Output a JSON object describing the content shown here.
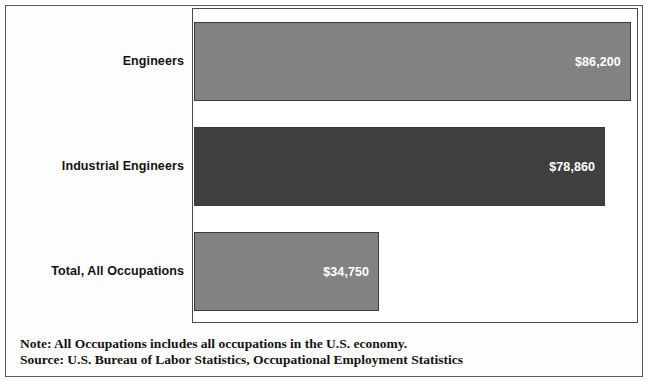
{
  "chart_data": {
    "type": "bar",
    "orientation": "horizontal",
    "title": "",
    "subtitle": "",
    "xlabel": "",
    "ylabel": "",
    "categories": [
      "Engineers",
      "Industrial Engineers",
      "Total, All Occupations"
    ],
    "values": [
      86200,
      78860,
      34750
    ],
    "value_labels": [
      "$86,200",
      "$78,860",
      "$34,750"
    ],
    "xlim": [
      0,
      88000
    ],
    "grid": false,
    "legend": false,
    "bar_colors": [
      "#828282",
      "#3f3f3f",
      "#828282"
    ],
    "value_label_color": "#ffffff",
    "series": [
      {
        "name": "Annual median wage",
        "values": [
          86200,
          78860,
          34750
        ]
      }
    ],
    "annotations": [
      "Note: All Occupations includes all occupations in the U.S. economy.",
      "Source: U.S. Bureau of Labor Statistics, Occupational Employment Statistics"
    ]
  },
  "chart": {
    "bars": [
      {
        "label": "Engineers",
        "value_label": "$86,200",
        "width_pct": 98.4,
        "style": "light"
      },
      {
        "label": "Industrial Engineers",
        "value_label": "$78,860",
        "width_pct": 92.6,
        "style": "dark"
      },
      {
        "label": "Total, All Occupations",
        "value_label": "$34,750",
        "width_pct": 41.7,
        "style": "light"
      }
    ]
  },
  "footnotes": {
    "note": "Note: All Occupations includes all occupations in the U.S. economy.",
    "source": "Source: U.S. Bureau of Labor Statistics, Occupational Employment Statistics"
  }
}
